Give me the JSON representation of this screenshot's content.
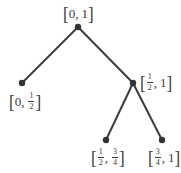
{
  "diagram": {
    "type": "binary-tree",
    "colors": {
      "edge": "#3c3c3c",
      "node": "#333333",
      "text": "#3a3a3a"
    },
    "nodes": [
      {
        "id": "root",
        "label": "[0, 1]",
        "left": "0",
        "right": "1",
        "x": 78,
        "y": 27
      },
      {
        "id": "left",
        "label": "[0, 1/2]",
        "left": "0",
        "right_num": "1",
        "right_den": "2",
        "x": 22,
        "y": 83
      },
      {
        "id": "right",
        "label": "[1/2, 1]",
        "left_num": "1",
        "left_den": "2",
        "right": "1",
        "x": 133,
        "y": 83
      },
      {
        "id": "right-left",
        "label": "[1/2, 3/4]",
        "left_num": "1",
        "left_den": "2",
        "right_num": "3",
        "right_den": "4",
        "x": 106,
        "y": 140
      },
      {
        "id": "right-right",
        "label": "[3/4, 1]",
        "left_num": "3",
        "left_den": "4",
        "right": "1",
        "x": 162,
        "y": 140
      }
    ],
    "edges": [
      [
        "root",
        "left"
      ],
      [
        "root",
        "right"
      ],
      [
        "right",
        "right-left"
      ],
      [
        "right",
        "right-right"
      ]
    ],
    "glyphs": {
      "open": "[",
      "close": "]",
      "comma": ","
    }
  }
}
